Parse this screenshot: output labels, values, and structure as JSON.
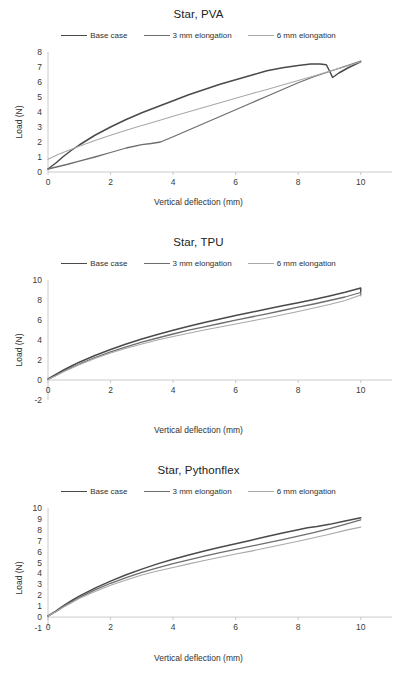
{
  "page": {
    "background": "#ffffff",
    "width": 397,
    "height": 685
  },
  "style": {
    "series_colors": [
      "#4a4a4a",
      "#6e6e6e",
      "#a9a9a9"
    ],
    "axis_color": "#bdbdbd",
    "text_color": "#303030"
  },
  "charts": [
    {
      "id": "star-pva",
      "title": "Star, PVA",
      "xlabel": "Vertical deflection (mm)",
      "ylabel": "Load (N)",
      "legend": [
        "Base case",
        "3 mm elongation",
        "6 mm elongation"
      ],
      "xticks": [
        0,
        2,
        4,
        6,
        8,
        10
      ],
      "yticks": [
        0,
        1,
        2,
        3,
        4,
        5,
        6,
        7,
        8
      ],
      "xlim": [
        0,
        11
      ],
      "ylim": [
        0,
        8
      ]
    },
    {
      "id": "star-tpu",
      "title": "Star, TPU",
      "xlabel": "Vertical deflection (mm)",
      "ylabel": "Load (N)",
      "legend": [
        "Base case",
        "3 mm elongation",
        "6 mm elongation"
      ],
      "xticks": [
        0,
        2,
        4,
        6,
        8,
        10
      ],
      "yticks": [
        -2,
        0,
        2,
        4,
        6,
        8,
        10
      ],
      "xlim": [
        0,
        11
      ],
      "ylim": [
        -2,
        10
      ]
    },
    {
      "id": "star-pythonflex",
      "title": "Star, Pythonflex",
      "xlabel": "Vertical deflection (mm)",
      "ylabel": "Load (N)",
      "legend": [
        "Base case",
        "3 mm elongation",
        "6 mm elongation"
      ],
      "xticks": [
        0,
        2,
        4,
        6,
        8,
        10
      ],
      "yticks": [
        -1,
        0,
        1,
        2,
        3,
        4,
        5,
        6,
        7,
        8,
        9,
        10
      ],
      "xlim": [
        0,
        11
      ],
      "ylim": [
        -1,
        10
      ]
    }
  ],
  "chart_data": [
    {
      "type": "line",
      "title": "Star, PVA",
      "xlabel": "Vertical deflection (mm)",
      "ylabel": "Load (N)",
      "xlim": [
        0,
        11
      ],
      "ylim": [
        0,
        8
      ],
      "xticks": [
        0,
        2,
        4,
        6,
        8,
        10
      ],
      "yticks": [
        0,
        1,
        2,
        3,
        4,
        5,
        6,
        7,
        8
      ],
      "grid": false,
      "legend_position": "top-center",
      "series": [
        {
          "name": "Base case",
          "color": "#4a4a4a",
          "x": [
            0,
            0.25,
            0.5,
            0.75,
            1.0,
            1.5,
            2.0,
            2.5,
            3.0,
            3.5,
            4.0,
            4.5,
            5.0,
            5.5,
            6.0,
            6.5,
            7.0,
            7.5,
            8.0,
            8.4,
            8.7,
            8.9,
            9.0,
            9.1,
            9.3,
            9.6,
            10.0
          ],
          "y": [
            0.2,
            0.6,
            1.05,
            1.45,
            1.8,
            2.45,
            3.0,
            3.5,
            3.95,
            4.35,
            4.75,
            5.15,
            5.5,
            5.85,
            6.15,
            6.45,
            6.75,
            6.95,
            7.1,
            7.2,
            7.2,
            7.15,
            6.75,
            6.3,
            6.6,
            6.95,
            7.35
          ]
        },
        {
          "name": "3 mm elongation",
          "color": "#6e6e6e",
          "x": [
            0,
            0.3,
            0.6,
            1.0,
            1.5,
            2.0,
            2.5,
            3.0,
            3.3,
            3.6,
            4.0,
            4.5,
            5.0,
            5.5,
            6.0,
            6.5,
            7.0,
            7.5,
            8.0,
            8.5,
            9.0,
            9.5,
            10.0
          ],
          "y": [
            0.2,
            0.35,
            0.5,
            0.72,
            1.0,
            1.3,
            1.6,
            1.82,
            1.9,
            2.0,
            2.35,
            2.8,
            3.25,
            3.7,
            4.15,
            4.6,
            5.05,
            5.5,
            5.95,
            6.35,
            6.7,
            7.05,
            7.4
          ]
        },
        {
          "name": "6 mm elongation",
          "color": "#a9a9a9",
          "x": [
            0,
            0.3,
            0.6,
            1.0,
            1.5,
            2.0,
            2.5,
            3.0,
            3.5,
            4.0,
            4.5,
            5.0,
            5.5,
            6.0,
            6.5,
            7.0,
            7.5,
            8.0,
            8.5,
            9.0,
            9.5,
            10.0
          ],
          "y": [
            0.85,
            1.15,
            1.4,
            1.72,
            2.1,
            2.45,
            2.78,
            3.1,
            3.4,
            3.72,
            4.02,
            4.32,
            4.62,
            4.92,
            5.22,
            5.5,
            5.8,
            6.1,
            6.4,
            6.72,
            7.02,
            7.35
          ]
        }
      ]
    },
    {
      "type": "line",
      "title": "Star, TPU",
      "xlabel": "Vertical deflection (mm)",
      "ylabel": "Load (N)",
      "xlim": [
        0,
        11
      ],
      "ylim": [
        -2,
        10
      ],
      "xticks": [
        0,
        2,
        4,
        6,
        8,
        10
      ],
      "yticks": [
        -2,
        0,
        2,
        4,
        6,
        8,
        10
      ],
      "grid": false,
      "legend_position": "top-center",
      "series": [
        {
          "name": "Base case",
          "color": "#4a4a4a",
          "x": [
            0,
            0.25,
            0.5,
            0.75,
            1.0,
            1.5,
            2.0,
            2.5,
            3.0,
            3.5,
            4.0,
            4.5,
            5.0,
            5.5,
            6.0,
            6.5,
            7.0,
            7.5,
            8.0,
            8.5,
            9.0,
            9.5,
            10.0,
            10.0
          ],
          "y": [
            0.1,
            0.55,
            1.0,
            1.4,
            1.78,
            2.45,
            3.05,
            3.6,
            4.1,
            4.55,
            4.98,
            5.38,
            5.75,
            6.1,
            6.45,
            6.78,
            7.1,
            7.42,
            7.72,
            8.05,
            8.4,
            8.78,
            9.2,
            8.85
          ]
        },
        {
          "name": "3 mm elongation",
          "color": "#6e6e6e",
          "x": [
            0,
            0.25,
            0.5,
            0.75,
            1.0,
            1.5,
            2.0,
            2.5,
            3.0,
            3.5,
            4.0,
            4.5,
            5.0,
            5.5,
            6.0,
            6.5,
            7.0,
            7.5,
            8.0,
            8.5,
            9.0,
            9.5,
            10.0,
            10.0
          ],
          "y": [
            0.05,
            0.45,
            0.88,
            1.25,
            1.6,
            2.25,
            2.82,
            3.32,
            3.78,
            4.2,
            4.6,
            4.98,
            5.32,
            5.65,
            5.98,
            6.3,
            6.62,
            6.95,
            7.28,
            7.6,
            7.95,
            8.3,
            8.75,
            8.5
          ]
        },
        {
          "name": "6 mm elongation",
          "color": "#a9a9a9",
          "x": [
            0,
            0.25,
            0.5,
            0.75,
            1.0,
            1.5,
            2.0,
            2.5,
            3.0,
            3.5,
            4.0,
            4.5,
            5.0,
            5.5,
            6.0,
            6.5,
            7.0,
            7.5,
            8.0,
            8.5,
            9.0,
            9.5,
            10.0,
            10.0
          ],
          "y": [
            0.05,
            0.42,
            0.82,
            1.18,
            1.52,
            2.15,
            2.7,
            3.18,
            3.6,
            4.0,
            4.35,
            4.68,
            5.0,
            5.3,
            5.6,
            5.9,
            6.2,
            6.52,
            6.85,
            7.2,
            7.55,
            7.95,
            8.5,
            8.4
          ]
        }
      ]
    },
    {
      "type": "line",
      "title": "Star, Pythonflex",
      "xlabel": "Vertical deflection (mm)",
      "ylabel": "Load (N)",
      "xlim": [
        0,
        11
      ],
      "ylim": [
        -1,
        10
      ],
      "xticks": [
        0,
        2,
        4,
        6,
        8,
        10
      ],
      "yticks": [
        -1,
        0,
        1,
        2,
        3,
        4,
        5,
        6,
        7,
        8,
        9,
        10
      ],
      "grid": false,
      "legend_position": "top-center",
      "series": [
        {
          "name": "Base case",
          "color": "#4a4a4a",
          "x": [
            0,
            0.25,
            0.5,
            0.75,
            1.0,
            1.5,
            2.0,
            2.5,
            3.0,
            3.5,
            4.0,
            4.5,
            5.0,
            5.5,
            6.0,
            6.5,
            7.0,
            7.5,
            8.0,
            8.3,
            8.6,
            9.0,
            9.5,
            10.0
          ],
          "y": [
            0.1,
            0.55,
            1.05,
            1.5,
            1.92,
            2.65,
            3.3,
            3.88,
            4.4,
            4.88,
            5.3,
            5.7,
            6.05,
            6.4,
            6.72,
            7.05,
            7.38,
            7.7,
            8.0,
            8.18,
            8.3,
            8.5,
            8.8,
            9.1
          ]
        },
        {
          "name": "3 mm elongation",
          "color": "#6e6e6e",
          "x": [
            0,
            0.25,
            0.5,
            0.75,
            1.0,
            1.5,
            2.0,
            2.5,
            3.0,
            3.5,
            4.0,
            4.5,
            5.0,
            5.5,
            6.0,
            6.5,
            7.0,
            7.5,
            8.0,
            8.5,
            9.0,
            9.5,
            10.0
          ],
          "y": [
            0.1,
            0.5,
            0.98,
            1.4,
            1.8,
            2.5,
            3.1,
            3.62,
            4.1,
            4.52,
            4.9,
            5.25,
            5.58,
            5.9,
            6.2,
            6.5,
            6.8,
            7.1,
            7.42,
            7.75,
            8.1,
            8.5,
            8.92
          ]
        },
        {
          "name": "6 mm elongation",
          "color": "#a9a9a9",
          "x": [
            0,
            0.25,
            0.5,
            0.75,
            1.0,
            1.5,
            2.0,
            2.5,
            3.0,
            3.5,
            4.0,
            4.5,
            5.0,
            5.5,
            6.0,
            6.5,
            7.0,
            7.5,
            8.0,
            8.5,
            9.0,
            9.5,
            10.0
          ],
          "y": [
            0.1,
            0.48,
            0.92,
            1.32,
            1.7,
            2.35,
            2.92,
            3.4,
            3.85,
            4.22,
            4.55,
            4.88,
            5.18,
            5.48,
            5.78,
            6.05,
            6.35,
            6.65,
            6.95,
            7.28,
            7.6,
            7.95,
            8.25
          ]
        }
      ]
    }
  ]
}
